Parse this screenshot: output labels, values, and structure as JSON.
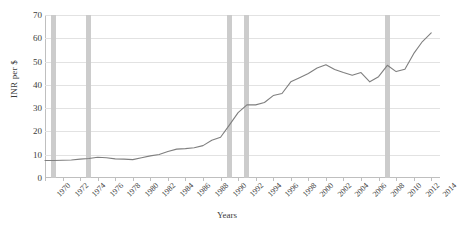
{
  "chart_data": {
    "type": "line",
    "title": "",
    "xlabel": "Years",
    "ylabel": "INR per $",
    "xlim": [
      1970,
      2015
    ],
    "ylim": [
      0,
      70
    ],
    "grid": true,
    "legend": "none",
    "y_ticks": [
      0,
      10,
      20,
      30,
      40,
      50,
      60,
      70
    ],
    "x_ticks": [
      1970,
      1972,
      1974,
      1976,
      1978,
      1980,
      1982,
      1984,
      1986,
      1988,
      1990,
      1992,
      1994,
      1996,
      1998,
      2000,
      2002,
      2004,
      2006,
      2008,
      2010,
      2012,
      2014
    ],
    "series": [
      {
        "name": "INR per $",
        "color": "#7f7f7f",
        "x": [
          1970,
          1971,
          1972,
          1973,
          1974,
          1975,
          1976,
          1977,
          1978,
          1979,
          1980,
          1981,
          1982,
          1983,
          1984,
          1985,
          1986,
          1987,
          1988,
          1989,
          1990,
          1991,
          1992,
          1993,
          1994,
          1995,
          1996,
          1997,
          1998,
          1999,
          2000,
          2001,
          2002,
          2003,
          2004,
          2005,
          2006,
          2007,
          2008,
          2009,
          2010,
          2011,
          2012,
          2013,
          2014
        ],
        "values": [
          7.5,
          7.5,
          7.6,
          7.7,
          8.1,
          8.4,
          8.9,
          8.7,
          8.2,
          8.1,
          7.9,
          8.7,
          9.5,
          10.1,
          11.4,
          12.4,
          12.6,
          13.0,
          13.9,
          16.2,
          17.5,
          22.7,
          28.1,
          31.4,
          31.4,
          32.4,
          35.4,
          36.3,
          41.3,
          43.1,
          44.9,
          47.2,
          48.6,
          46.6,
          45.3,
          44.1,
          45.3,
          41.3,
          43.5,
          48.4,
          45.7,
          46.7,
          53.4,
          58.6,
          62.3
        ]
      }
    ],
    "highlight_bars": [
      {
        "label": "1971",
        "year": 1971
      },
      {
        "label": "1975",
        "year": 1975
      },
      {
        "label": "1991",
        "year": 1991
      },
      {
        "label": "1993",
        "year": 1993
      },
      {
        "label": "2009",
        "year": 2009
      }
    ]
  }
}
